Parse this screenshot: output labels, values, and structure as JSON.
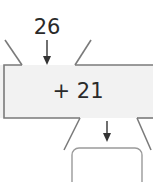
{
  "diagram": {
    "type": "function-machine",
    "input_value": "26",
    "operation": "+ 21",
    "output_value": "",
    "colors": {
      "machine_fill": "#f2f2f2",
      "stroke": "#7a7a7a",
      "arrow": "#333333",
      "text": "#2a2a2a",
      "answer_box_stroke": "#9a9a9a"
    }
  }
}
